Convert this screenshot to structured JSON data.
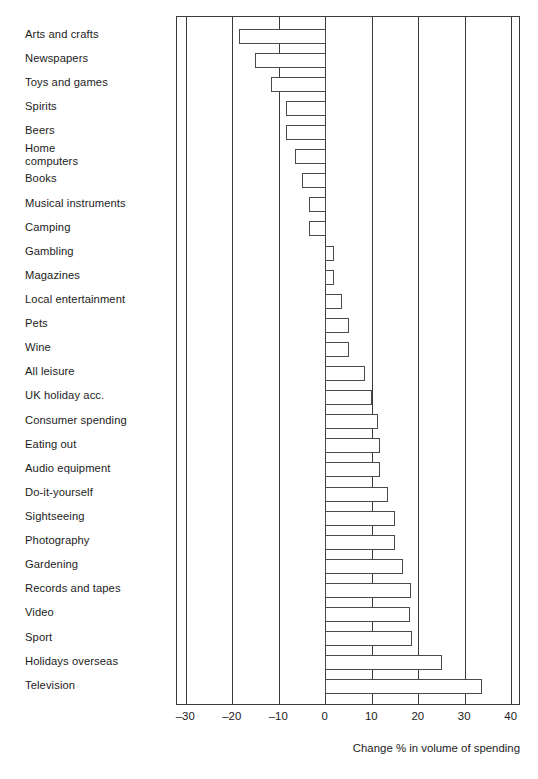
{
  "chart_data": {
    "type": "bar",
    "orientation": "horizontal",
    "title": "",
    "xlabel": "Change % in volume of spending",
    "ylabel": "",
    "xlim": [
      -32,
      42
    ],
    "xticks": [
      -30,
      -20,
      -10,
      0,
      10,
      20,
      30,
      40
    ],
    "xtick_labels": [
      "–30",
      "–20",
      "–10",
      "0",
      "10",
      "20",
      "30",
      "40"
    ],
    "grid": "vertical",
    "legend": "none",
    "zero_line": 0,
    "categories": [
      "Arts and crafts",
      "Newspapers",
      "Toys and games",
      "Spirits",
      "Beers",
      "Home\ncomputers",
      "Books",
      "Musical instruments",
      "Camping",
      "Gambling",
      "Magazines",
      "Local entertainment",
      "Pets",
      "Wine",
      "All leisure",
      "UK holiday acc.",
      "Consumer spending",
      "Eating out",
      "Audio equipment",
      "Do-it-yourself",
      "Sightseeing",
      "Photography",
      "Gardening",
      "Records and tapes",
      "Video",
      "Sport",
      "Holidays overseas",
      "Television"
    ],
    "values": [
      -18.5,
      -15.0,
      -11.5,
      -8.3,
      -8.3,
      -6.5,
      -4.8,
      -3.3,
      -3.3,
      1.8,
      1.8,
      3.6,
      5.0,
      5.0,
      8.5,
      9.9,
      11.3,
      11.7,
      11.7,
      13.4,
      15.0,
      15.0,
      16.7,
      18.3,
      18.2,
      18.6,
      25.0,
      33.6
    ]
  },
  "axis_title": "Change % in volume of spending",
  "caption": ""
}
